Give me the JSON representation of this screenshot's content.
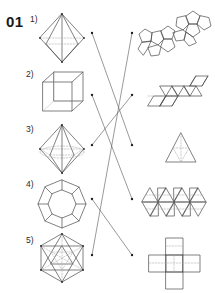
{
  "worksheet": {
    "exercise_number": "01",
    "background_color": "#ffffff",
    "line_color": "#4a4a4a",
    "hidden_line_color": "#aaaaaa",
    "connector_color": "#555555",
    "width": 215,
    "height": 293
  },
  "left_column": {
    "title": "three-dimensional solids",
    "items": [
      {
        "label": "1)",
        "shape_name": "octahedron-solid",
        "row": 1,
        "center_y": 38
      },
      {
        "label": "2)",
        "shape_name": "cube-solid",
        "row": 2,
        "center_y": 95
      },
      {
        "label": "3)",
        "shape_name": "hexagonal-bipyramid-solid",
        "row": 3,
        "center_y": 149
      },
      {
        "label": "4)",
        "shape_name": "dodecahedron-solid",
        "row": 4,
        "center_y": 203
      },
      {
        "label": "5)",
        "shape_name": "icosahedron-solid",
        "row": 5,
        "center_y": 259
      }
    ]
  },
  "right_column": {
    "title": "flat nets",
    "items": [
      {
        "shape_name": "dodecahedron-net",
        "row": 1,
        "center_y": 33
      },
      {
        "shape_name": "octahedron-net-strip",
        "row": 2,
        "center_y": 93
      },
      {
        "shape_name": "tetrahedron-net",
        "row": 3,
        "center_y": 148
      },
      {
        "shape_name": "icosahedron-net-strip",
        "row": 4,
        "center_y": 203
      },
      {
        "shape_name": "cube-net-cross",
        "row": 5,
        "center_y": 259
      }
    ]
  },
  "connectors": {
    "left_nodes_x": 92,
    "right_nodes_x": 132,
    "left_node_y": [
      33,
      95,
      145,
      199,
      255
    ],
    "right_node_y": [
      33,
      95,
      145,
      199,
      255
    ],
    "links": [
      {
        "from": 1,
        "to": 3
      },
      {
        "from": 2,
        "to": 4
      },
      {
        "from": 3,
        "to": 2
      },
      {
        "from": 4,
        "to": 5
      },
      {
        "from": 5,
        "to": 1
      }
    ]
  }
}
